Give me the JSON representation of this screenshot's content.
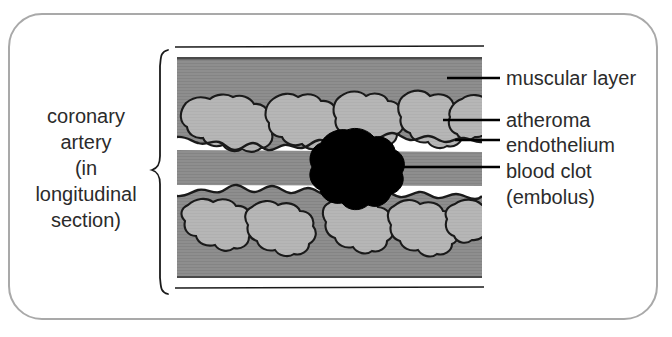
{
  "figure": {
    "title_left": {
      "lines": [
        "coronary",
        "artery",
        "(in",
        "longitudinal",
        "section)"
      ],
      "text": "coronary\nartery\n(in\nlongitudinal\nsection)"
    },
    "labels": {
      "muscular_layer": "muscular layer",
      "atheroma": "atheroma",
      "endothelium": "endothelium",
      "blood_clot": "blood clot\n(embolus)",
      "blood_clot_line1": "blood clot",
      "blood_clot_line2": "(embolus)"
    },
    "colors": {
      "frame_border": "#a9a9a9",
      "muscular_layer_fill": "#8e8e8e",
      "atheroma_fill": "#b6b6b6",
      "blood_clot_fill": "#000000",
      "outline": "#1a1a1a",
      "lumen": "#ffffff",
      "text": "#2b2b2b",
      "background": "#ffffff"
    },
    "structures": [
      {
        "name": "muscular layer",
        "description": "outer darker gray textured wall of the artery"
      },
      {
        "name": "atheroma",
        "description": "lighter gray irregular plaque deposits lining the vessel wall"
      },
      {
        "name": "endothelium",
        "description": "dark outline bordering the lumen over the atheroma"
      },
      {
        "name": "blood clot (embolus)",
        "description": "black irregular mass occluding the narrowed lumen"
      }
    ],
    "view": "longitudinal section",
    "vessel": "coronary artery"
  }
}
